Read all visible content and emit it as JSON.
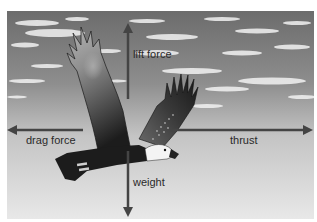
{
  "diagram": {
    "labels": {
      "lift": "lift force",
      "drag": "drag force",
      "thrust": "thrust",
      "weight": "weight"
    },
    "colors": {
      "sky_top": "#6e6e6e",
      "sky_bottom": "#e6e6e6",
      "arrow": "#444444",
      "bird_dark": "#1e1e1e",
      "head_white": "#f4f4f4",
      "text": "#2a2a2a"
    }
  }
}
